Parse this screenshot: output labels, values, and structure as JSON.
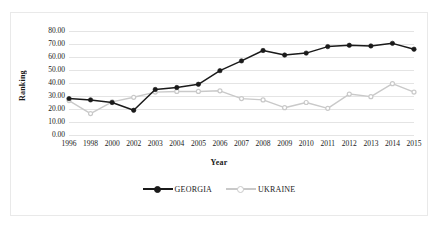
{
  "chart_data": {
    "type": "line",
    "title": "",
    "xlabel": "Year",
    "ylabel": "Ranking",
    "categories": [
      "1996",
      "1998",
      "2000",
      "2002",
      "2003",
      "2004",
      "2005",
      "2006",
      "2007",
      "2008",
      "2009",
      "2010",
      "2011",
      "2012",
      "2013",
      "2014",
      "2015"
    ],
    "ylim": [
      0,
      80
    ],
    "ytick_labels": [
      "80.00",
      "70.00",
      "60.00",
      "50.00",
      "40.00",
      "30.00",
      "20.00",
      "10.00",
      "0.00"
    ],
    "ytick_values": [
      80,
      70,
      60,
      50,
      40,
      30,
      20,
      10,
      0
    ],
    "grid": true,
    "legend_position": "bottom",
    "series": [
      {
        "name": "GEORGIA",
        "color": "#1a1a1a",
        "marker": "filled-circle",
        "values": [
          28.0,
          27.0,
          25.0,
          19.0,
          35.0,
          36.5,
          39.0,
          49.5,
          57.0,
          65.0,
          61.5,
          63.0,
          68.0,
          69.0,
          68.5,
          70.5,
          66.0
        ]
      },
      {
        "name": "UKRAINE",
        "color": "#c9c9c9",
        "marker": "open-circle",
        "values": [
          26.5,
          16.5,
          25.5,
          29.0,
          33.0,
          33.5,
          33.5,
          34.0,
          28.0,
          27.0,
          21.0,
          25.0,
          20.5,
          31.5,
          29.5,
          39.5,
          33.0
        ]
      }
    ]
  },
  "legend": {
    "items": [
      {
        "label": "GEORGIA"
      },
      {
        "label": "UKRAINE"
      }
    ]
  },
  "colors": {
    "georgia": "#1a1a1a",
    "ukraine": "#c9c9c9",
    "gridline": "#e4e4e4",
    "frame": "#e9e9e9",
    "text": "#1a1a1a"
  }
}
